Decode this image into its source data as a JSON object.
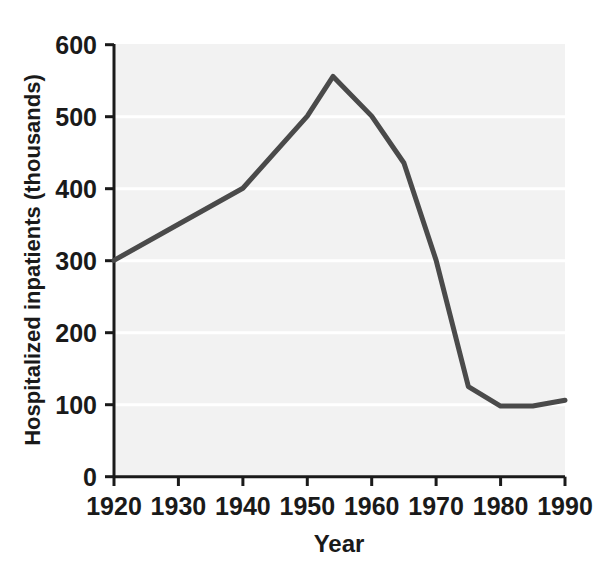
{
  "chart_data": {
    "type": "line",
    "title": "",
    "xlabel": "Year",
    "ylabel": "Hospitalized inpatients (thousands)",
    "xlim": [
      1920,
      1990
    ],
    "ylim": [
      0,
      600
    ],
    "xticks": [
      1920,
      1930,
      1940,
      1950,
      1960,
      1970,
      1980,
      1990
    ],
    "xtick_labels": [
      "1920",
      "1930",
      "1940",
      "1950",
      "1960",
      "1970",
      "1980",
      "1990"
    ],
    "yticks": [
      0,
      100,
      200,
      300,
      400,
      500,
      600
    ],
    "ytick_labels": [
      "0",
      "100",
      "200",
      "300",
      "400",
      "500",
      "600"
    ],
    "grid": true,
    "grid_axis": "y",
    "legend": "none",
    "series": [
      {
        "name": "Hospitalized inpatients",
        "color": "#4a4a4a",
        "line_width": 5,
        "x": [
          1920,
          1930,
          1940,
          1950,
          1954,
          1960,
          1965,
          1970,
          1975,
          1980,
          1985,
          1990
        ],
        "y": [
          300,
          350,
          400,
          500,
          555,
          500,
          435,
          300,
          125,
          98,
          98,
          106
        ]
      }
    ],
    "plot_background": "#f2f2f2",
    "axis_color": "#1a1a1a",
    "grid_color": "#ffffff"
  },
  "figure": {
    "background": "#ffffff"
  }
}
